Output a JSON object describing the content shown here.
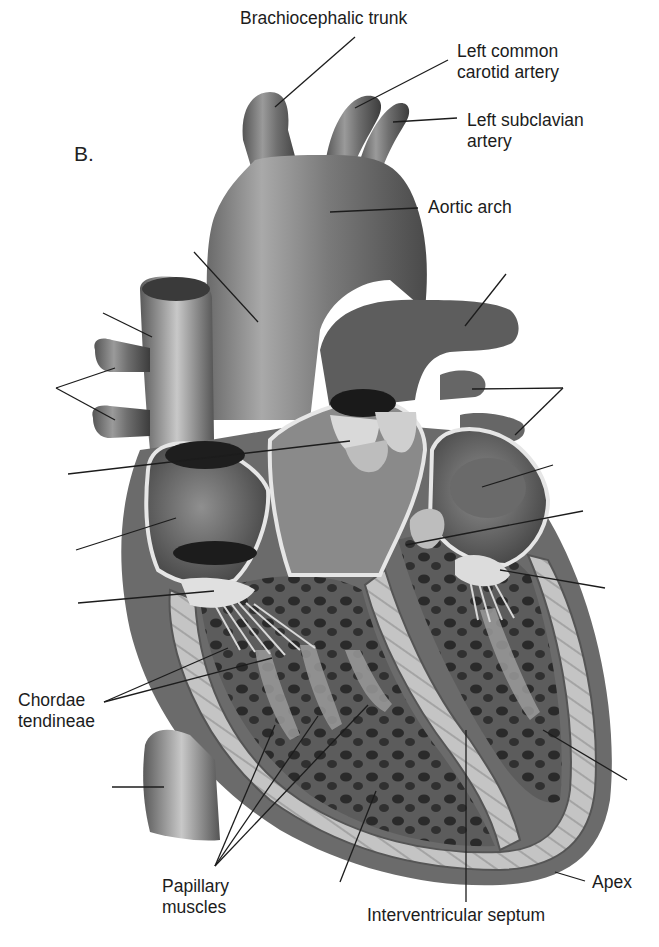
{
  "figure": {
    "panel_letter": "B.",
    "background": "#ffffff",
    "ink_color": "#1c1c1c"
  },
  "labels": {
    "brachiocephalic_trunk": {
      "text": "Brachiocephalic trunk",
      "x": 240,
      "y": 8
    },
    "left_common_carotid": {
      "line1": "Left common",
      "line2": "carotid artery",
      "x": 457,
      "y": 41
    },
    "left_subclavian": {
      "line1": "Left subclavian",
      "line2": "artery",
      "x": 467,
      "y": 110
    },
    "aortic_arch": {
      "text": "Aortic arch",
      "x": 428,
      "y": 197
    },
    "chordae_tendineae": {
      "line1": "Chordae",
      "line2": "tendineae",
      "x": 18,
      "y": 690
    },
    "papillary_muscles": {
      "line1": "Papillary",
      "line2": "muscles",
      "x": 162,
      "y": 876
    },
    "apex": {
      "text": "Apex",
      "x": 592,
      "y": 872
    },
    "interventricular_septum": {
      "text": "Interventricular septum",
      "x": 367,
      "y": 905
    }
  },
  "leader_lines": [
    {
      "name": "brachiocephalic-trunk-line",
      "x1": 355,
      "y1": 37,
      "x2": 275,
      "y2": 107
    },
    {
      "name": "left-common-carotid-line",
      "x1": 448,
      "y1": 60,
      "x2": 355,
      "y2": 108
    },
    {
      "name": "left-subclavian-line",
      "x1": 457,
      "y1": 118,
      "x2": 393,
      "y2": 122
    },
    {
      "name": "aortic-arch-line",
      "x1": 418,
      "y1": 208,
      "x2": 330,
      "y2": 212
    },
    {
      "name": "superior-vena-cava-line-blank",
      "x1": 103,
      "y1": 313,
      "x2": 152,
      "y2": 337
    },
    {
      "name": "ascending-aorta-line-blank",
      "x1": 194,
      "y1": 252,
      "x2": 258,
      "y2": 322
    },
    {
      "name": "pulmonary-trunk-line-blank",
      "x1": 506,
      "y1": 274,
      "x2": 465,
      "y2": 326
    },
    {
      "name": "right-pulmonary-veins-line-a-blank",
      "x1": 56,
      "y1": 388,
      "x2": 115,
      "y2": 368
    },
    {
      "name": "right-pulmonary-veins-line-b-blank",
      "x1": 56,
      "y1": 388,
      "x2": 115,
      "y2": 420
    },
    {
      "name": "left-pulmonary-veins-line-a-blank",
      "x1": 563,
      "y1": 388,
      "x2": 472,
      "y2": 389
    },
    {
      "name": "left-pulmonary-veins-line-b-blank",
      "x1": 563,
      "y1": 388,
      "x2": 515,
      "y2": 435
    },
    {
      "name": "aortic-valve-line-blank",
      "x1": 68,
      "y1": 474,
      "x2": 350,
      "y2": 441
    },
    {
      "name": "left-atrium-line-blank",
      "x1": 553,
      "y1": 465,
      "x2": 482,
      "y2": 487
    },
    {
      "name": "tricuspid-valve-line-blank",
      "x1": 76,
      "y1": 550,
      "x2": 176,
      "y2": 518
    },
    {
      "name": "mitral-valve-line-blank",
      "x1": 583,
      "y1": 511,
      "x2": 406,
      "y2": 545
    },
    {
      "name": "right-ventricle-outflow-line-blank",
      "x1": 78,
      "y1": 603,
      "x2": 214,
      "y2": 591
    },
    {
      "name": "left-ventricle-valve-line-blank",
      "x1": 605,
      "y1": 588,
      "x2": 500,
      "y2": 570
    },
    {
      "name": "chordae-line-a",
      "x1": 104,
      "y1": 702,
      "x2": 228,
      "y2": 648
    },
    {
      "name": "chordae-line-b",
      "x1": 104,
      "y1": 702,
      "x2": 272,
      "y2": 658
    },
    {
      "name": "inferior-vena-cava-line-blank",
      "x1": 112,
      "y1": 787,
      "x2": 164,
      "y2": 787
    },
    {
      "name": "papillary-line-a",
      "x1": 215,
      "y1": 866,
      "x2": 275,
      "y2": 725
    },
    {
      "name": "papillary-line-b",
      "x1": 215,
      "y1": 866,
      "x2": 318,
      "y2": 716
    },
    {
      "name": "papillary-line-c",
      "x1": 215,
      "y1": 866,
      "x2": 368,
      "y2": 705
    },
    {
      "name": "right-ventricle-line-blank",
      "x1": 340,
      "y1": 882,
      "x2": 376,
      "y2": 791
    },
    {
      "name": "interventricular-septum-line",
      "x1": 466,
      "y1": 902,
      "x2": 466,
      "y2": 730
    },
    {
      "name": "left-ventricle-line-blank",
      "x1": 627,
      "y1": 780,
      "x2": 543,
      "y2": 730
    },
    {
      "name": "apex-line",
      "x1": 585,
      "y1": 881,
      "x2": 555,
      "y2": 872
    }
  ]
}
